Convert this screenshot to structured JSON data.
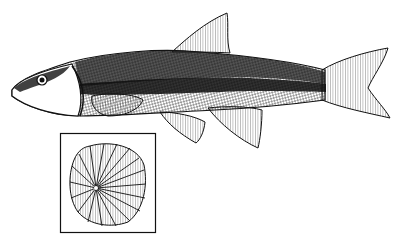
{
  "figure": {
    "inset": "scale detail",
    "colors": {
      "ink": "#111111",
      "paper": "#ffffff",
      "shade": "#333333"
    }
  }
}
